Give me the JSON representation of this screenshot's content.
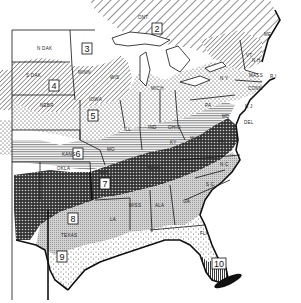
{
  "map": {
    "title": "Eastern United States zone map",
    "style": "black-and-white hatched regions",
    "zones": [
      {
        "number": "2",
        "pattern": "wide diagonal hatch",
        "region": "Northern Great Lakes / Ontario / Northern New England"
      },
      {
        "number": "3",
        "pattern": "white",
        "region": "North Dakota / Northern Minnesota"
      },
      {
        "number": "4",
        "pattern": "diagonal hatch",
        "region": "South Dakota / Southern Minnesota / Wisconsin / Nebraska"
      },
      {
        "number": "5",
        "pattern": "dots",
        "region": "Iowa / Illinois / Indiana / Ohio / Michigan / Pennsylvania / New York"
      },
      {
        "number": "6",
        "pattern": "horizontal lines",
        "region": "Kansas / Missouri / Kentucky / West Virginia"
      },
      {
        "number": "7",
        "pattern": "crosshatch dark",
        "region": "Oklahoma / Arkansas / Tennessee / Virginia"
      },
      {
        "number": "8",
        "pattern": "light gray stipple",
        "region": "Texas / Louisiana / Mississippi / Alabama / Georgia / Carolinas"
      },
      {
        "number": "9",
        "pattern": "sparse dots",
        "region": "South Texas / Gulf coast"
      },
      {
        "number": "10",
        "pattern": "vertical stripes",
        "region": "South Florida"
      }
    ],
    "state_labels": [
      {
        "text": "N DAK",
        "x": 37,
        "y": 50
      },
      {
        "text": "S DAK",
        "x": 26,
        "y": 77
      },
      {
        "text": "MINN",
        "x": 78,
        "y": 74
      },
      {
        "text": "WIS",
        "x": 110,
        "y": 79
      },
      {
        "text": "NEBR",
        "x": 40,
        "y": 107
      },
      {
        "text": "IOWA",
        "x": 89,
        "y": 101
      },
      {
        "text": "ILL",
        "x": 124,
        "y": 131
      },
      {
        "text": "IND",
        "x": 148,
        "y": 129
      },
      {
        "text": "OHIO",
        "x": 168,
        "y": 129
      },
      {
        "text": "MICH",
        "x": 151,
        "y": 90
      },
      {
        "text": "PA",
        "x": 205,
        "y": 107
      },
      {
        "text": "N Y",
        "x": 220,
        "y": 80
      },
      {
        "text": "ME",
        "x": 264,
        "y": 36
      },
      {
        "text": "N H",
        "x": 252,
        "y": 62
      },
      {
        "text": "VT",
        "x": 246,
        "y": 57
      },
      {
        "text": "MASS",
        "x": 249,
        "y": 77
      },
      {
        "text": "CONN",
        "x": 248,
        "y": 90
      },
      {
        "text": "R I",
        "x": 270,
        "y": 78
      },
      {
        "text": "N J",
        "x": 245,
        "y": 108
      },
      {
        "text": "DEL",
        "x": 244,
        "y": 124
      },
      {
        "text": "MD",
        "x": 222,
        "y": 118
      },
      {
        "text": "W VA",
        "x": 190,
        "y": 140
      },
      {
        "text": "VA",
        "x": 218,
        "y": 143
      },
      {
        "text": "KY",
        "x": 170,
        "y": 144
      },
      {
        "text": "TENN",
        "x": 147,
        "y": 170
      },
      {
        "text": "N C",
        "x": 220,
        "y": 166
      },
      {
        "text": "S C",
        "x": 206,
        "y": 186
      },
      {
        "text": "GA",
        "x": 183,
        "y": 203
      },
      {
        "text": "ALA",
        "x": 155,
        "y": 207
      },
      {
        "text": "MISS",
        "x": 129,
        "y": 207
      },
      {
        "text": "LA",
        "x": 110,
        "y": 221
      },
      {
        "text": "FLA",
        "x": 200,
        "y": 235
      },
      {
        "text": "KANS",
        "x": 62,
        "y": 156
      },
      {
        "text": "MO",
        "x": 107,
        "y": 151
      },
      {
        "text": "OKLA",
        "x": 57,
        "y": 170
      },
      {
        "text": "ARK",
        "x": 99,
        "y": 174
      },
      {
        "text": "TEXAS",
        "x": 61,
        "y": 237
      },
      {
        "text": "ONT",
        "x": 138,
        "y": 19
      }
    ],
    "zone_labels": [
      {
        "number": "2",
        "x": 157,
        "y": 30
      },
      {
        "number": "3",
        "x": 87,
        "y": 50
      },
      {
        "number": "4",
        "x": 54,
        "y": 87
      },
      {
        "number": "5",
        "x": 93,
        "y": 117
      },
      {
        "number": "6",
        "x": 78,
        "y": 155
      },
      {
        "number": "7",
        "x": 105,
        "y": 185
      },
      {
        "number": "8",
        "x": 73,
        "y": 220
      },
      {
        "number": "9",
        "x": 62,
        "y": 258
      },
      {
        "number": "10",
        "x": 219,
        "y": 265
      }
    ]
  }
}
